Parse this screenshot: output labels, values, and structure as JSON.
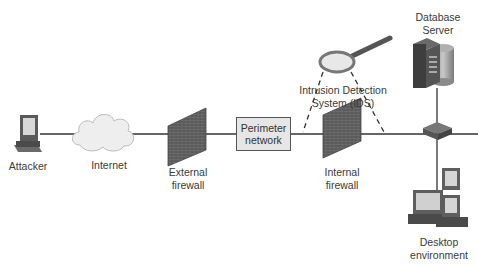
{
  "nodes": {
    "attacker": {
      "label": "Attacker"
    },
    "internet": {
      "label": "Internet"
    },
    "external_firewall": {
      "line1": "External",
      "line2": "firewall"
    },
    "perimeter_network": {
      "line1": "Perimeter",
      "line2": "network"
    },
    "ids": {
      "line1": "Intrusion Detection",
      "line2": "System (IDS)"
    },
    "internal_firewall": {
      "line1": "Internal",
      "line2": "firewall"
    },
    "database_server": {
      "line1": "Database",
      "line2": "Server"
    },
    "desktop_environment": {
      "line1": "Desktop",
      "line2": "environment"
    }
  },
  "colors": {
    "line": "#333333",
    "firewall": "#555555",
    "box_fill": "#e6e6e6",
    "cloud": "#eeeeee"
  }
}
